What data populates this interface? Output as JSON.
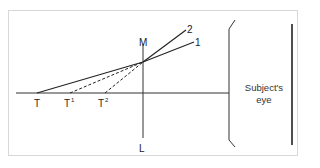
{
  "diagram": {
    "labels": {
      "M": "M",
      "L": "L",
      "T": "T",
      "T1_base": "T",
      "T1_sup": "1",
      "T2_base": "T",
      "T2_sup": "2",
      "ray_1": "1",
      "ray_2": "2"
    },
    "eye_label_line1": "Subject's",
    "eye_label_line2": "eye",
    "colors": {
      "line": "#222222",
      "frame": "#d8d8d8"
    }
  }
}
